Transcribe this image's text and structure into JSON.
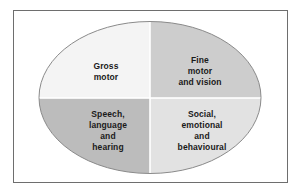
{
  "diagram": {
    "shape": "ellipse",
    "frame": {
      "border_color": "#6e6e6e",
      "background_color": "#ffffff"
    },
    "ellipse": {
      "stroke_color": "#8a8a8a",
      "center_x": 112,
      "center_y": 76.5,
      "radius_x": 111,
      "radius_y": 76
    },
    "divider": {
      "vertical_x": 112,
      "horizontal_y": 77,
      "color": "#ffffff"
    },
    "quadrants": [
      {
        "id": "gross-motor",
        "position": "top-left",
        "label": "Gross\nmotor",
        "fill": "#f4f4f4",
        "text_color": "#1a1a1a"
      },
      {
        "id": "fine-motor-and-vision",
        "position": "top-right",
        "label": "Fine\nmotor\nand vision",
        "fill": "#cdcdcd",
        "text_color": "#1a1a1a"
      },
      {
        "id": "speech-language-and-hearing",
        "position": "bottom-left",
        "label": "Speech,\nlanguage\nand\nhearing",
        "fill": "#bcbcbc",
        "text_color": "#1a1a1a"
      },
      {
        "id": "social-emotional-and-behavioural",
        "position": "bottom-right",
        "label": "Social,\nemotional\nand\nbehavioural",
        "fill": "#e2e2e2",
        "text_color": "#1a1a1a"
      }
    ]
  }
}
